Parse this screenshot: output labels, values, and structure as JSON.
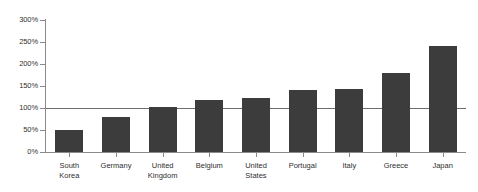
{
  "chart_data": {
    "type": "bar",
    "title": "",
    "subtitle": "",
    "xlabel": "",
    "ylabel": "",
    "categories": [
      "South\nKorea",
      "Germany",
      "United\nKingdom",
      "Belgium",
      "United\nStates",
      "Portugal",
      "Italy",
      "Greece",
      "Japan"
    ],
    "values": [
      50,
      80,
      103,
      118,
      122,
      141,
      143,
      180,
      240
    ],
    "ylim": [
      0,
      300
    ],
    "ytick_values": [
      0,
      50,
      100,
      150,
      200,
      250,
      300
    ],
    "ytick_labels": [
      "0%",
      "50%",
      "100%",
      "150%",
      "200%",
      "250%",
      "300%"
    ],
    "grid": false,
    "legend": null,
    "reference_line": {
      "value": 100,
      "label": ""
    },
    "series": [
      {
        "name": "",
        "values": [
          50,
          80,
          103,
          118,
          122,
          141,
          143,
          180,
          240
        ]
      }
    ],
    "colors": {
      "bar": "#3c3c3c",
      "axis": "#8a8a8a",
      "reference_line": "#6f6f6f",
      "text": "#2f2f2f",
      "background": "#ffffff"
    }
  }
}
